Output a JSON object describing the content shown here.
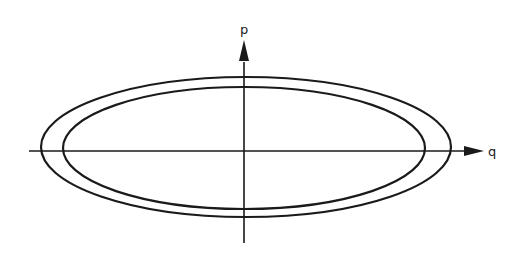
{
  "diagram": {
    "type": "phase-space",
    "axes": {
      "horizontal": {
        "label": "q"
      },
      "vertical": {
        "label": "p"
      }
    },
    "curves": [
      {
        "name": "outer-ellipse",
        "cx": 246,
        "cy": 151,
        "rx": 205,
        "ry": 70
      },
      {
        "name": "inner-ellipse",
        "cx": 244,
        "cy": 148,
        "rx": 181,
        "ry": 61
      }
    ],
    "colors": {
      "stroke": "#1a1a1a",
      "background": "#ffffff"
    }
  }
}
